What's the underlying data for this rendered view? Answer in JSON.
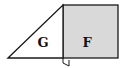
{
  "diagram": {
    "shapes": [
      {
        "id": "triangle",
        "label": "G",
        "fill": "#ffffff",
        "stroke": "#1a1a1a"
      },
      {
        "id": "square",
        "label": "F",
        "fill": "#d9d9d9",
        "stroke": "#1a1a1a"
      }
    ],
    "labels": {
      "triangle": "G",
      "square": "F"
    },
    "right_angle_marker": true
  }
}
